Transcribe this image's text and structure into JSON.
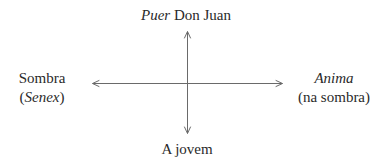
{
  "diagram": {
    "top": {
      "italic": "Puer",
      "text": " Don Juan"
    },
    "bottom": {
      "text": "A jovem"
    },
    "left": {
      "line1": "Sombra",
      "line2_open": "(",
      "line2_italic": "Senex",
      "line2_close": ")"
    },
    "right": {
      "line1_italic": "Anima",
      "line2": "(na sombra)"
    },
    "axes": {
      "vertical": {
        "x": 187,
        "y_top": 31,
        "y_bottom": 134
      },
      "horizontal": {
        "y": 83,
        "x_left": 92,
        "x_right": 283
      }
    },
    "colors": {
      "line": "#6a6a6a",
      "text": "#2a2a2a"
    }
  }
}
